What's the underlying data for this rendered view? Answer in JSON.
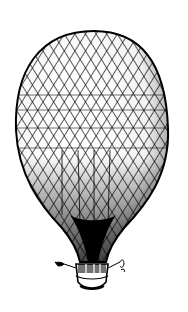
{
  "image": {
    "subject": "hot-air balloon engraving",
    "style": "black and white crosshatched etching",
    "colors": {
      "background": "#ffffff",
      "ink": "#000000"
    },
    "elements": [
      "balloon-envelope",
      "rope-netting",
      "gondola-basket",
      "left-pennant",
      "right-pennant"
    ]
  }
}
